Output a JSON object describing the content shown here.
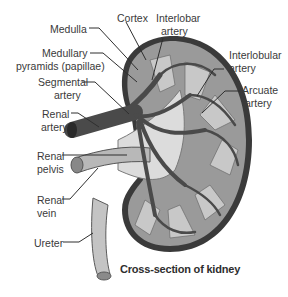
{
  "diagram": {
    "caption": "Cross-section of kidney",
    "labels": {
      "medulla": "Medulla",
      "cortex": "Cortex",
      "interlobar_artery_1": "Interlobar",
      "interlobar_artery_2": "artery",
      "medullary_pyramids_1": "Medullary",
      "medullary_pyramids_2": "pyramids (papillae)",
      "segmental_artery_1": "Segmental",
      "segmental_artery_2": "artery",
      "renal_artery_1": "Renal",
      "renal_artery_2": "artery",
      "interlobular_artery_1": "Interlobular",
      "interlobular_artery_2": "artery",
      "arcuate_artery_1": "Arcuate",
      "arcuate_artery_2": "artery",
      "renal_pelvis_1": "Renal",
      "renal_pelvis_2": "pelvis",
      "renal_vein_1": "Renal",
      "renal_vein_2": "vein",
      "ureter": "Ureter"
    },
    "colors": {
      "capsule": "#3a3a3a",
      "cortex": "#9a9a9a",
      "medulla": "#c8c8c8",
      "artery": "#4a4a4a",
      "pelvis": "#dcdcdc",
      "ureter": "#c4c4c4"
    }
  }
}
